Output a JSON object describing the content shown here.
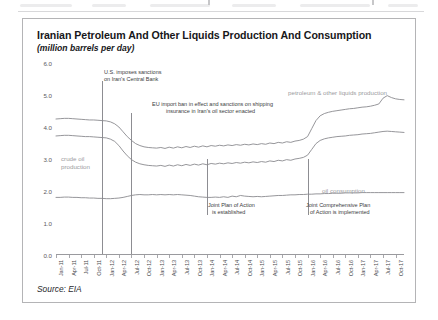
{
  "figure": {
    "title": "Iranian Petroleum And Other Liquids Production And Consumption",
    "subtitle": "(million barrels per day)",
    "source": "Source: EIA"
  },
  "series_labels": {
    "production": "petroleum & other liquids production",
    "crude": "crude oil\nproduction",
    "crude_line1": "crude oil",
    "crude_line2": "production",
    "consumption": "oil consumption"
  },
  "annotations": [
    {
      "id": "us-sanctions-central-bank",
      "line1": "U.S. imposes sanctions",
      "line2": "on Iran's Central Bank",
      "at_x": "Dec-11"
    },
    {
      "id": "eu-import-ban",
      "line1": "EU import ban in effect and sanctions on shipping",
      "line2": "insurance in Iran's oil sector enacted",
      "at_x": "Jul-12"
    },
    {
      "id": "joint-plan-of-action",
      "line1": "Joint Plan of Action",
      "line2": "is established",
      "at_x": "Jan-14"
    },
    {
      "id": "jcpoa-implemented",
      "line1": "Joint Comprehensive Plan",
      "line2": "of Action is implemented",
      "at_x": "Jan-16"
    }
  ],
  "chart_data": {
    "type": "line",
    "title": "Iranian Petroleum And Other Liquids Production And Consumption",
    "subtitle": "(million barrels per day)",
    "xlabel": "",
    "ylabel": "million barrels per day",
    "ylim": [
      0.0,
      6.0
    ],
    "yticks": [
      0.0,
      1.0,
      2.0,
      3.0,
      4.0,
      5.0,
      6.0
    ],
    "ytick_labels": [
      "0.0",
      "1.0",
      "2.0",
      "3.0",
      "4.0",
      "5.0",
      "6.0"
    ],
    "grid": false,
    "legend": "inline-labels",
    "x_tick_labels": [
      "Jan-11",
      "Apr-11",
      "Jul-11",
      "Oct-11",
      "Jan-12",
      "Apr-12",
      "Jul-12",
      "Oct-12",
      "Jan-13",
      "Apr-13",
      "Jul-13",
      "Oct-13",
      "Jan-14",
      "Apr-14",
      "Jul-14",
      "Oct-14",
      "Jan-15",
      "Apr-15",
      "Jul-15",
      "Oct-15",
      "Jan-16",
      "Apr-16",
      "Jul-16",
      "Oct-16",
      "Jan-17",
      "Apr-17",
      "Jul-17",
      "Oct-17"
    ],
    "x_start": "Jan-11",
    "x_end": "Dec-17",
    "series": [
      {
        "name": "petroleum & other liquids production",
        "color": "#8a8a8f",
        "values": [
          4.25,
          4.26,
          4.27,
          4.27,
          4.26,
          4.25,
          4.24,
          4.23,
          4.22,
          4.22,
          4.21,
          4.2,
          4.19,
          4.16,
          4.1,
          4.0,
          3.85,
          3.7,
          3.58,
          3.48,
          3.42,
          3.38,
          3.36,
          3.35,
          3.34,
          3.36,
          3.33,
          3.37,
          3.34,
          3.38,
          3.35,
          3.39,
          3.36,
          3.4,
          3.37,
          3.41,
          3.38,
          3.42,
          3.4,
          3.43,
          3.41,
          3.44,
          3.42,
          3.45,
          3.43,
          3.46,
          3.44,
          3.47,
          3.45,
          3.48,
          3.46,
          3.5,
          3.48,
          3.52,
          3.5,
          3.54,
          3.52,
          3.56,
          3.58,
          3.62,
          3.7,
          3.95,
          4.2,
          4.35,
          4.42,
          4.46,
          4.49,
          4.51,
          4.53,
          4.55,
          4.57,
          4.58,
          4.6,
          4.62,
          4.63,
          4.65,
          4.68,
          4.72,
          4.9,
          4.98,
          4.92,
          4.88,
          4.86,
          4.85
        ]
      },
      {
        "name": "crude oil production",
        "color": "#8a8a8f",
        "values": [
          3.72,
          3.73,
          3.74,
          3.74,
          3.73,
          3.72,
          3.71,
          3.7,
          3.7,
          3.69,
          3.68,
          3.67,
          3.66,
          3.62,
          3.55,
          3.42,
          3.25,
          3.1,
          2.98,
          2.9,
          2.85,
          2.82,
          2.8,
          2.79,
          2.78,
          2.8,
          2.77,
          2.81,
          2.78,
          2.82,
          2.79,
          2.83,
          2.8,
          2.84,
          2.81,
          2.85,
          2.82,
          2.86,
          2.84,
          2.87,
          2.85,
          2.88,
          2.86,
          2.89,
          2.87,
          2.9,
          2.88,
          2.91,
          2.89,
          2.92,
          2.9,
          2.94,
          2.92,
          2.96,
          2.94,
          2.98,
          2.96,
          3.0,
          3.02,
          3.05,
          3.12,
          3.3,
          3.48,
          3.58,
          3.63,
          3.66,
          3.68,
          3.7,
          3.71,
          3.72,
          3.74,
          3.75,
          3.76,
          3.78,
          3.79,
          3.8,
          3.82,
          3.84,
          3.86,
          3.87,
          3.86,
          3.85,
          3.84,
          3.83
        ]
      },
      {
        "name": "oil consumption",
        "color": "#8a8a8f",
        "values": [
          1.8,
          1.8,
          1.81,
          1.81,
          1.8,
          1.8,
          1.79,
          1.79,
          1.78,
          1.78,
          1.77,
          1.77,
          1.76,
          1.76,
          1.77,
          1.78,
          1.8,
          1.83,
          1.86,
          1.88,
          1.89,
          1.88,
          1.88,
          1.89,
          1.88,
          1.89,
          1.88,
          1.89,
          1.88,
          1.89,
          1.88,
          1.87,
          1.86,
          1.84,
          1.82,
          1.81,
          1.8,
          1.8,
          1.81,
          1.8,
          1.82,
          1.8,
          1.84,
          1.82,
          1.86,
          1.84,
          1.83,
          1.82,
          1.83,
          1.82,
          1.83,
          1.84,
          1.85,
          1.86,
          1.86,
          1.87,
          1.88,
          1.88,
          1.89,
          1.89,
          1.9,
          1.9,
          1.91,
          1.91,
          1.92,
          1.92,
          1.93,
          1.93,
          1.93,
          1.94,
          1.94,
          1.94,
          1.94,
          1.95,
          1.95,
          1.95,
          1.95,
          1.95,
          1.95,
          1.95,
          1.95,
          1.95,
          1.95,
          1.95
        ]
      }
    ]
  }
}
